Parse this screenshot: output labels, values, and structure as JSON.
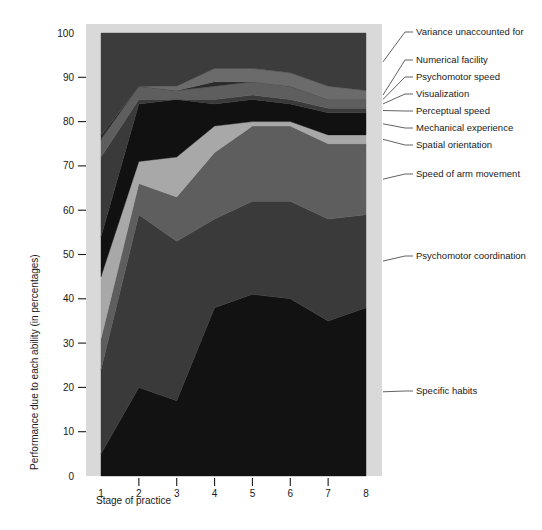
{
  "chart_data": {
    "type": "area",
    "stacked": true,
    "title": "",
    "xlabel": "Stage of practice",
    "ylabel": "Performance due to each ability (in percentages)",
    "x": [
      1,
      2,
      3,
      4,
      5,
      6,
      7,
      8
    ],
    "xtick_labels": [
      "1",
      "2",
      "3",
      "4",
      "5",
      "6",
      "7",
      "8"
    ],
    "ytick_labels": [
      "0",
      "10",
      "20",
      "30",
      "40",
      "50",
      "60",
      "70",
      "80",
      "90",
      "100"
    ],
    "yticks": [
      0,
      10,
      20,
      30,
      40,
      50,
      60,
      70,
      80,
      90,
      100
    ],
    "ylim": [
      0,
      100
    ],
    "xlim": [
      1,
      8
    ],
    "grid": false,
    "legend_position": "right-leader-lines",
    "series": [
      {
        "name": "Specific habits",
        "color": "#121212",
        "values": [
          5,
          20,
          17,
          38,
          41,
          40,
          35,
          38
        ],
        "cumulative_top": [
          5,
          20,
          17,
          38,
          41,
          40,
          35,
          38
        ]
      },
      {
        "name": "Psychomotor coordination",
        "color": "#3a3a3a",
        "values": [
          19,
          39,
          36,
          20,
          21,
          22,
          23,
          21
        ],
        "cumulative_top": [
          24,
          59,
          53,
          58,
          62,
          62,
          58,
          59
        ]
      },
      {
        "name": "Speed of arm movement",
        "color": "#5e5e5e",
        "values": [
          7,
          7,
          10,
          15,
          17,
          17,
          17,
          16
        ],
        "cumulative_top": [
          31,
          66,
          63,
          73,
          79,
          79,
          75,
          75
        ]
      },
      {
        "name": "Spatial orientation",
        "color": "#a8a8a8",
        "values": [
          14,
          5,
          9,
          6,
          1,
          1,
          2,
          2
        ],
        "cumulative_top": [
          45,
          71,
          72,
          79,
          80,
          80,
          77,
          77
        ]
      },
      {
        "name": "Mechanical experience",
        "color": "#111111",
        "values": [
          9,
          13,
          13,
          5,
          5,
          4,
          5,
          5
        ],
        "cumulative_top": [
          54,
          84,
          85,
          84,
          85,
          84,
          82,
          82
        ]
      },
      {
        "name": "Perceptual speed",
        "color": "#3a3a3a",
        "values": [
          18,
          1,
          0,
          1,
          1,
          1,
          1,
          1
        ],
        "cumulative_top": [
          72,
          85,
          85,
          85,
          86,
          85,
          83,
          83
        ]
      },
      {
        "name": "Visualization",
        "color": "#5e5e5e",
        "values": [
          4,
          3,
          2,
          3,
          3,
          3,
          2,
          2
        ],
        "cumulative_top": [
          76,
          88,
          87,
          88,
          89,
          88,
          85,
          85
        ]
      },
      {
        "name": "Psychomotor speed",
        "color": "#2b2b2b",
        "values": [
          1,
          0,
          0,
          1,
          0,
          0,
          0,
          0
        ],
        "cumulative_top": [
          77,
          88,
          87,
          89,
          89,
          88,
          85,
          85
        ]
      },
      {
        "name": "Numerical facility",
        "color": "#6b6b6b",
        "values": [
          0,
          0,
          1,
          3,
          3,
          3,
          3,
          2
        ],
        "cumulative_top": [
          77,
          88,
          88,
          92,
          92,
          91,
          88,
          87
        ]
      },
      {
        "name": "Variance unaccounted for",
        "color": "#3c3c3c",
        "values": [
          23,
          12,
          12,
          8,
          8,
          9,
          12,
          13
        ],
        "cumulative_top": [
          100,
          100,
          100,
          100,
          100,
          100,
          100,
          100
        ]
      }
    ],
    "legend_labels": [
      "Variance unaccounted for",
      "Numerical facility",
      "Psychomotor speed",
      "Visualization",
      "Perceptual speed",
      "Mechanical experience",
      "Spatial orientation",
      "Speed of arm movement",
      "Psychomotor coordination",
      "Specific habits"
    ]
  }
}
